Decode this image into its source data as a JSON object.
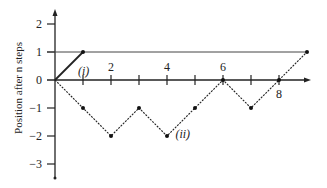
{
  "chart_data": {
    "type": "line",
    "title": "",
    "xlabel": "",
    "ylabel": "Position after n steps",
    "x_tick_labels": [
      {
        "value": 2,
        "label": "2",
        "position": "above"
      },
      {
        "value": 4,
        "label": "4",
        "position": "above"
      },
      {
        "value": 6,
        "label": "6",
        "position": "above"
      },
      {
        "value": 8,
        "label": "8",
        "position": "below"
      }
    ],
    "x_ticks": [
      1,
      2,
      3,
      4,
      5,
      6,
      7,
      8
    ],
    "y_tick_labels": [
      {
        "value": 2,
        "label": "2"
      },
      {
        "value": 1,
        "label": "1"
      },
      {
        "value": 0,
        "label": "0"
      },
      {
        "value": -1,
        "label": "−1"
      },
      {
        "value": -2,
        "label": "−2"
      },
      {
        "value": -3,
        "label": "−3"
      }
    ],
    "xlim": [
      0,
      9.3
    ],
    "ylim": [
      -3.5,
      2.5
    ],
    "reference_line": {
      "y": 1,
      "x_range": [
        0,
        9
      ]
    },
    "series": [
      {
        "name": "(i)",
        "label": "(i)",
        "style": "solid",
        "x": [
          0,
          1
        ],
        "y": [
          0,
          1
        ]
      },
      {
        "name": "(ii)",
        "label": "(ii)",
        "style": "dotted",
        "x": [
          0,
          1,
          2,
          3,
          4,
          5,
          6,
          7,
          8,
          9
        ],
        "y": [
          0,
          -1,
          -2,
          -1,
          -2,
          -1,
          0,
          -1,
          0,
          1
        ]
      }
    ],
    "grid": false,
    "legend": "inline labels"
  }
}
